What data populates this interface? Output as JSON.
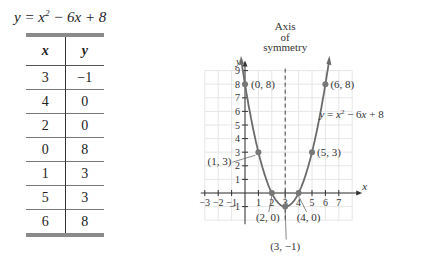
{
  "table": {
    "title_prefix": "y = x",
    "title_exp": "2",
    "title_suffix": " − 6x + 8",
    "headers": [
      "x",
      "y"
    ],
    "rows": [
      [
        "3",
        "−1"
      ],
      [
        "4",
        "0"
      ],
      [
        "2",
        "0"
      ],
      [
        "0",
        "8"
      ],
      [
        "1",
        "3"
      ],
      [
        "5",
        "3"
      ],
      [
        "6",
        "8"
      ]
    ]
  },
  "chart_data": {
    "type": "line",
    "title": "",
    "equation": "y = x^2 - 6x + 8",
    "xlabel": "x",
    "ylabel": "y",
    "xlim": [
      -3,
      8
    ],
    "ylim": [
      -2,
      9
    ],
    "grid": true,
    "x_ticks": [
      -3,
      -2,
      -1,
      1,
      2,
      3,
      4,
      5,
      6,
      7
    ],
    "y_ticks": [
      -1,
      1,
      2,
      3,
      4,
      5,
      6,
      7,
      8,
      9
    ],
    "points": [
      {
        "x": 0,
        "y": 8,
        "label": "(0, 8)"
      },
      {
        "x": 1,
        "y": 3,
        "label": "(1, 3)"
      },
      {
        "x": 2,
        "y": 0,
        "label": "(2, 0)"
      },
      {
        "x": 3,
        "y": -1,
        "label": "(3, −1)"
      },
      {
        "x": 4,
        "y": 0,
        "label": "(4, 0)"
      },
      {
        "x": 5,
        "y": 3,
        "label": "(5, 3)"
      },
      {
        "x": 6,
        "y": 8,
        "label": "(6, 8)"
      }
    ],
    "axis_of_symmetry": {
      "x": 3,
      "label": [
        "Axis",
        "of",
        "symmetry"
      ]
    },
    "curve_label": "y = x² − 6x + 8"
  }
}
